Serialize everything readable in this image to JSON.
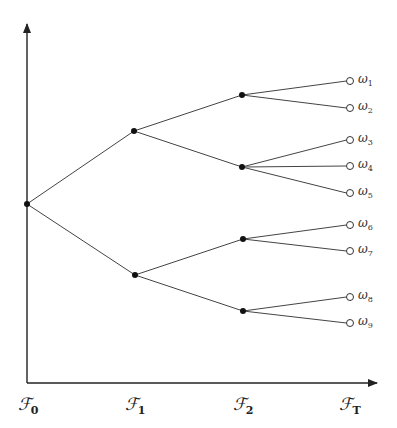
{
  "diagram": {
    "type": "event-tree",
    "axes": {
      "origin": [
        27,
        383
      ],
      "x_end": [
        377,
        383
      ],
      "y_end": [
        27,
        24
      ],
      "color": "#222222"
    },
    "time_labels": [
      {
        "symbol": "ℱ",
        "sub": "0",
        "x": 28
      },
      {
        "symbol": "ℱ",
        "sub": "1",
        "x": 135
      },
      {
        "symbol": "ℱ",
        "sub": "2",
        "x": 243
      },
      {
        "symbol": "ℱ",
        "sub": "T",
        "x": 350
      }
    ],
    "nodes": [
      {
        "id": "n0",
        "x": 27,
        "y": 204,
        "level": 0
      },
      {
        "id": "n1a",
        "x": 134,
        "y": 131,
        "level": 1
      },
      {
        "id": "n1b",
        "x": 135,
        "y": 275,
        "level": 1
      },
      {
        "id": "n2a",
        "x": 242,
        "y": 95,
        "level": 2
      },
      {
        "id": "n2b",
        "x": 242,
        "y": 167,
        "level": 2
      },
      {
        "id": "n2c",
        "x": 243,
        "y": 239,
        "level": 2
      },
      {
        "id": "n2d",
        "x": 243,
        "y": 311,
        "level": 2
      }
    ],
    "leaves": [
      {
        "id": "w1",
        "label": "ω",
        "sub": "1",
        "x": 350,
        "y": 81,
        "parent": "n2a"
      },
      {
        "id": "w2",
        "label": "ω",
        "sub": "2",
        "x": 350,
        "y": 108,
        "parent": "n2a"
      },
      {
        "id": "w3",
        "label": "ω",
        "sub": "3",
        "x": 350,
        "y": 140,
        "parent": "n2b"
      },
      {
        "id": "w4",
        "label": "ω",
        "sub": "4",
        "x": 350,
        "y": 166,
        "parent": "n2b"
      },
      {
        "id": "w5",
        "label": "ω",
        "sub": "5",
        "x": 350,
        "y": 193,
        "parent": "n2b"
      },
      {
        "id": "w6",
        "label": "ω",
        "sub": "6",
        "x": 350,
        "y": 225,
        "parent": "n2c"
      },
      {
        "id": "w7",
        "label": "ω",
        "sub": "7",
        "x": 350,
        "y": 251,
        "parent": "n2c"
      },
      {
        "id": "w8",
        "label": "ω",
        "sub": "8",
        "x": 350,
        "y": 297,
        "parent": "n2d"
      },
      {
        "id": "w9",
        "label": "ω",
        "sub": "9",
        "x": 350,
        "y": 323,
        "parent": "n2d"
      }
    ],
    "edges": [
      [
        "n0",
        "n1a"
      ],
      [
        "n0",
        "n1b"
      ],
      [
        "n1a",
        "n2a"
      ],
      [
        "n1a",
        "n2b"
      ],
      [
        "n1b",
        "n2c"
      ],
      [
        "n1b",
        "n2d"
      ]
    ],
    "colors": {
      "line": "#444444",
      "node_fill": "#111111",
      "leaf_stroke": "#333333",
      "leaf_fill": "#ffffff"
    }
  }
}
